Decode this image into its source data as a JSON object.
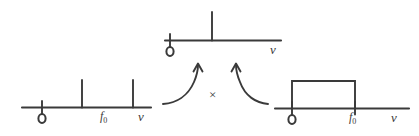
{
  "figure": {
    "style": "hand-drawn sketch",
    "background_color": "#ffffff",
    "ink_color": "#3a3a3a",
    "operator": {
      "symbol": "×",
      "name": "multiplication-sign"
    }
  },
  "panels": {
    "result": {
      "name": "result-spectrum",
      "position": "top-center",
      "axis_label": "ν",
      "origin_label": "0",
      "impulses": [
        {
          "label": "",
          "position_fraction": 0.41,
          "height_fraction": 1.0
        }
      ],
      "rectangles": []
    },
    "input": {
      "name": "input-spectrum",
      "position": "bottom-left",
      "axis_label": "ν",
      "origin_label": "0",
      "marker_label": "f",
      "marker_subscript": "0",
      "impulses": [
        {
          "label": "",
          "position_fraction": 0.47,
          "height_fraction": 1.0
        },
        {
          "label": "",
          "position_fraction": 0.87,
          "height_fraction": 1.0
        }
      ],
      "rectangles": []
    },
    "filter": {
      "name": "filter-response",
      "position": "bottom-right",
      "axis_label": "ν",
      "origin_label": "0",
      "marker_label": "f",
      "marker_subscript": "0",
      "impulses": [],
      "rectangles": [
        {
          "start_fraction": 0.13,
          "end_fraction": 0.6,
          "height_fraction": 1.0
        }
      ]
    }
  },
  "arrows": [
    {
      "name": "arrow-from-input",
      "from": "input-spectrum",
      "to": "result-spectrum",
      "direction": "up-right"
    },
    {
      "name": "arrow-from-filter",
      "from": "filter-response",
      "to": "result-spectrum",
      "direction": "up-left"
    }
  ]
}
